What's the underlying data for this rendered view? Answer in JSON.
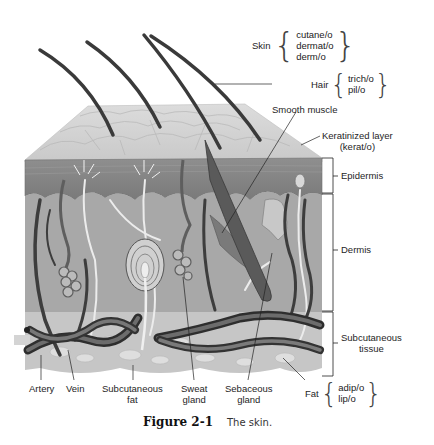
{
  "figure": {
    "number": "Figure 2-1",
    "caption": "The skin."
  },
  "labels": {
    "skin": {
      "term": "Skin",
      "roots": [
        "cutane/o",
        "dermat/o",
        "derm/o"
      ]
    },
    "hair": {
      "term": "Hair",
      "roots": [
        "trich/o",
        "pil/o"
      ]
    },
    "smooth_muscle": "Smooth muscle",
    "keratinized_layer": {
      "line1": "Keratinized layer",
      "line2": "(kerat/o)"
    },
    "epidermis": "Epidermis",
    "dermis": "Dermis",
    "subcutaneous_tissue": {
      "line1": "Subcutaneous",
      "line2": "tissue"
    },
    "fat": {
      "term": "Fat",
      "roots": [
        "adip/o",
        "lip/o"
      ]
    },
    "artery": "Artery",
    "vein": "Vein",
    "subcutaneous_fat": {
      "line1": "Subcutaneous",
      "line2": "fat"
    },
    "sweat_gland": {
      "line1": "Sweat",
      "line2": "gland"
    },
    "sebaceous_gland": {
      "line1": "Sebaceous",
      "line2": "gland"
    }
  },
  "braces": {
    "open": "{",
    "close": "}"
  }
}
